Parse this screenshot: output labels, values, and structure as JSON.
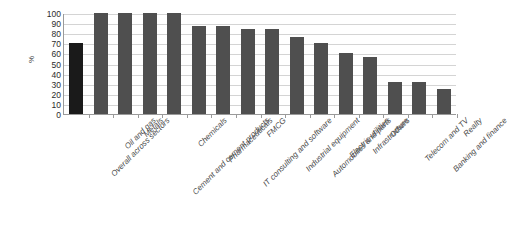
{
  "chart_data": {
    "type": "bar",
    "title": "",
    "subtitle": "",
    "xlabel": "",
    "ylabel": "%",
    "ylim": [
      0,
      100
    ],
    "ytick_step": 10,
    "yticks": [
      100,
      90,
      80,
      70,
      60,
      50,
      40,
      30,
      20,
      10,
      0
    ],
    "grid": true,
    "legend": null,
    "legend_position": "none",
    "orientation": "vertical",
    "categories": [
      "Overall across sectors",
      "Oil and gas",
      "Metals",
      "Cement and cement products",
      "Chemicals",
      "Pharmaceuticals",
      "IT consulting and software",
      "FMCG",
      "Industrial equipment",
      "Automobiles and parts",
      "Electric utilities",
      "Infrastructure",
      "Others",
      "Telecom and TV",
      "Banking and finance",
      "Realty"
    ],
    "values": [
      70,
      100,
      100,
      100,
      100,
      87,
      87,
      84,
      84,
      76,
      70,
      60,
      56,
      32,
      32,
      25
    ],
    "bar_colors": [
      "#1a1a1a",
      "#4f4f4f",
      "#4f4f4f",
      "#4f4f4f",
      "#4f4f4f",
      "#4f4f4f",
      "#4f4f4f",
      "#4f4f4f",
      "#4f4f4f",
      "#4f4f4f",
      "#4f4f4f",
      "#4f4f4f",
      "#4f4f4f",
      "#4f4f4f",
      "#4f4f4f",
      "#4f4f4f"
    ],
    "highlight_color": "#1a1a1a",
    "series_color": "#4f4f4f",
    "gridline_color": "#d4d4d4",
    "axis_color": "#9a9a9a",
    "background_color": "#ffffff"
  }
}
